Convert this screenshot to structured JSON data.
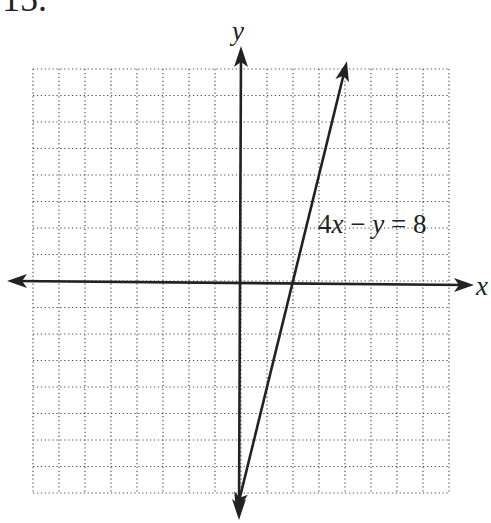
{
  "problem": {
    "number": "15."
  },
  "chart_data": {
    "type": "line",
    "title": "",
    "xlabel": "x",
    "ylabel": "y",
    "xlim": [
      -8,
      8
    ],
    "ylim": [
      -8,
      8
    ],
    "grid": true,
    "grid_style": "dotted",
    "grid_step": 1,
    "tick_labels": false,
    "series": [
      {
        "name": "4x − y = 8",
        "equation": "y = 4x - 8",
        "x": [
          0,
          1,
          2,
          3,
          4
        ],
        "y": [
          -8,
          -4,
          0,
          4,
          8
        ],
        "arrows_both_ends": true
      }
    ],
    "annotations": [
      {
        "text": "4x − y = 8",
        "x": 3.2,
        "y": 2.2
      }
    ]
  },
  "labels": {
    "x_axis": "x",
    "y_axis": "y",
    "equation_parts": {
      "a": "4",
      "v1": "x",
      "op": " − ",
      "v2": "y",
      "eq": " = 8"
    }
  },
  "colors": {
    "ink": "#222222",
    "grid": "#555555",
    "background": "#ffffff"
  }
}
